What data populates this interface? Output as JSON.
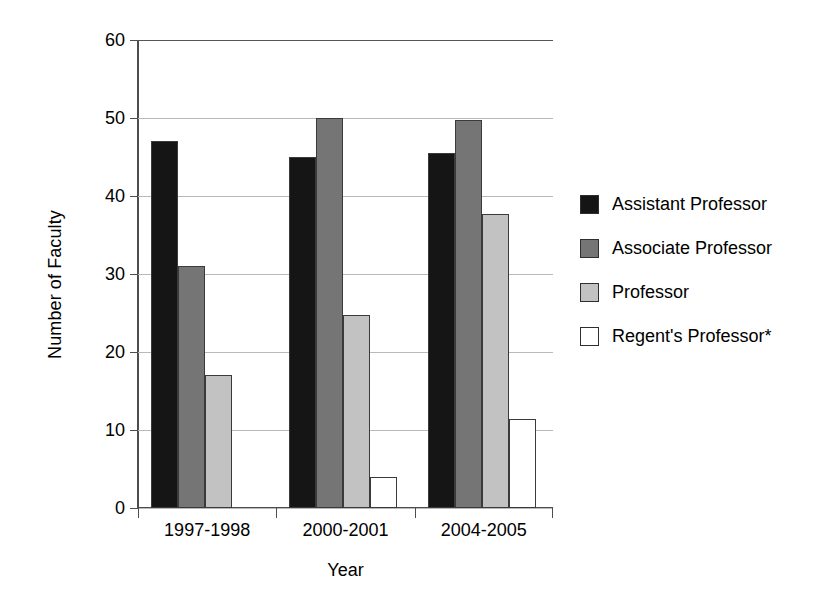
{
  "chart_data": {
    "type": "bar",
    "title": "",
    "xlabel": "Year",
    "ylabel": "Number of Faculty",
    "categories": [
      "1997-1998",
      "2000-2001",
      "2004-2005"
    ],
    "series": [
      {
        "name": "Assistant Professor",
        "values": [
          47,
          45,
          45.5
        ],
        "color": "#151515"
      },
      {
        "name": "Associate Professor",
        "values": [
          31,
          50,
          49.7
        ],
        "color": "#757575"
      },
      {
        "name": "Professor",
        "values": [
          17,
          24.7,
          37.7
        ],
        "color": "#c2c2c2"
      },
      {
        "name": "Regent's Professor*",
        "values": [
          0,
          4,
          11.4
        ],
        "color": "#ffffff"
      }
    ],
    "ylim": [
      0,
      60
    ],
    "yticks": [
      0,
      10,
      20,
      30,
      40,
      50,
      60
    ],
    "ytick_labels": [
      "0",
      "10",
      "20",
      "30",
      "40",
      "50",
      "60"
    ],
    "grid": true,
    "legend_position": "right"
  }
}
